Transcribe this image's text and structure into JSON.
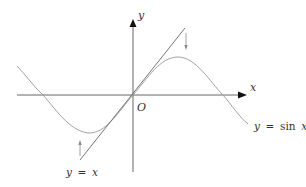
{
  "figure": {
    "colors": {
      "axis": "#555555",
      "sine": "#9a9a9a",
      "line": "#666666",
      "pointer": "#8a8a8a",
      "text": "#333333"
    },
    "axes": {
      "x_label": "x",
      "y_label": "y",
      "origin_label": "O"
    },
    "curves": [
      {
        "name": "sine",
        "label_lhs": "y",
        "label_eq": "=",
        "label_fn": "sin",
        "label_var": "x",
        "label": "y = sin x"
      },
      {
        "name": "identity",
        "label_lhs": "y",
        "label_eq": "=",
        "label_var": "x",
        "label": "y = x"
      }
    ],
    "annotations": [
      {
        "type": "arrow-down",
        "near": "tangent line above peak"
      },
      {
        "type": "arrow-up",
        "near": "tangent line below trough"
      }
    ]
  }
}
